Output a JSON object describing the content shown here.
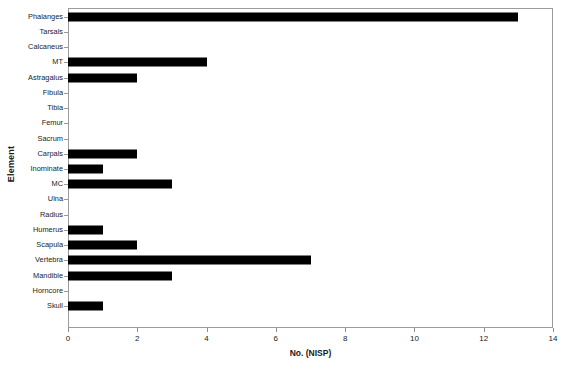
{
  "chart_data": {
    "type": "bar",
    "orientation": "horizontal",
    "title": "",
    "xlabel": "No. (NISP)",
    "ylabel": "Element",
    "xlim": [
      0,
      14
    ],
    "xticks": [
      0,
      2,
      4,
      6,
      8,
      10,
      12,
      14
    ],
    "grid": false,
    "legend": false,
    "bar_color": "#000000",
    "frame_color": "#9b9b9b",
    "categories": [
      "Phalanges",
      "Tarsals",
      "Calcaneus",
      "MT",
      "Astragalus",
      "Fibula",
      "Tibia",
      "Femur",
      "Sacrum",
      "Carpals",
      "Inominate",
      "MC",
      "Ulna",
      "Radius",
      "Humerus",
      "Scapula",
      "Vertebra",
      "Mandible",
      "Horncore",
      "Skull"
    ],
    "values": [
      13,
      0,
      0,
      4,
      2,
      0,
      0,
      0,
      0,
      2,
      1,
      3,
      0,
      0,
      1,
      2,
      7,
      3,
      0,
      1
    ]
  }
}
